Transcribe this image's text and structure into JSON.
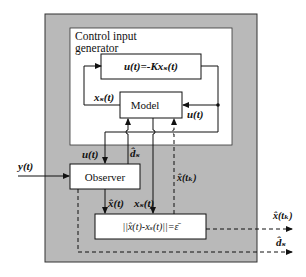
{
  "diagram": {
    "outer_container": {
      "fill": "#b9b9b9",
      "border": "#333333"
    },
    "control_generator": {
      "title_line1": "Control input",
      "title_line2": "generator",
      "fill": "#ffffff"
    },
    "blocks": {
      "control_law": "u(t)=-Kxₛ(t)",
      "model": "Model",
      "observer": "Observer",
      "trigger_condition": "||x̂(t)-xₛ(t)||=ε̄"
    },
    "signals": {
      "y": "y(t)",
      "u_top": "u(t)",
      "u_mid": "u(t)",
      "xs_left": "xₛ(t)",
      "d_hat_up": "d̂ₛ",
      "x_hat": "x̂(t)",
      "xs_down": "xₛ(t)",
      "x_hat_tk": "x̂(tₖ)",
      "out_x_hat_tk": "x̂(tₖ)",
      "out_d_hat": "d̂ₛ"
    },
    "line_color": "#111111"
  }
}
